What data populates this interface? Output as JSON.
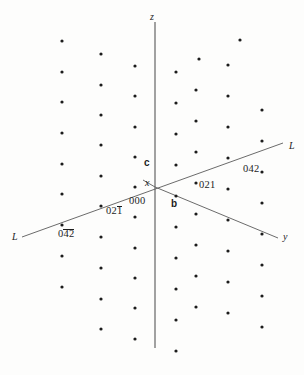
{
  "figure": {
    "type": "reciprocal-lattice-diagram",
    "background": "#fdfdfc",
    "ink": "#1c1c1c",
    "axis_color": "#8a8a8a",
    "line_color": "#5a5a5a",
    "dot_color": "#1c1c1c",
    "origin": {
      "x": 155,
      "y": 187
    }
  },
  "axes": [
    {
      "name": "z-axis",
      "label": "z",
      "label_x": 150,
      "label_y": 12,
      "x1": 155,
      "y1": 22,
      "x2": 155,
      "y2": 348
    },
    {
      "name": "y-axis",
      "label": "y",
      "label_x": 283,
      "label_y": 232,
      "x1": 155,
      "y1": 187,
      "x2": 278,
      "y2": 238
    },
    {
      "name": "x-axis",
      "label": "x",
      "label_x": 145,
      "label_y": 178,
      "x1": 155,
      "y1": 187,
      "x2": 143,
      "y2": 180
    }
  ],
  "reciprocal_rows": [
    {
      "name": "row-line-L",
      "label_left": "L",
      "label_right": "L",
      "label_left_x": 12,
      "label_left_y": 232,
      "label_right_x": 289,
      "label_right_y": 141,
      "x1": 22,
      "y1": 237,
      "x2": 283,
      "y2": 143
    }
  ],
  "vectors": [
    {
      "name": "c-vector",
      "label": "c",
      "x": 144,
      "y": 158
    },
    {
      "name": "b-vector",
      "label": "b",
      "x": 171,
      "y": 199
    }
  ],
  "indices": [
    {
      "name": "index-000",
      "text": "000",
      "x": 129,
      "y": 196,
      "bars": []
    },
    {
      "name": "index-021",
      "text": "021",
      "x": 199,
      "y": 180,
      "bars": []
    },
    {
      "name": "index-042",
      "text": "042",
      "x": 243,
      "y": 164,
      "bars": []
    },
    {
      "name": "index-021-bar",
      "text": "021",
      "x": 106,
      "y": 206,
      "bars": [
        2
      ]
    },
    {
      "name": "index-042-bar",
      "text": "042",
      "x": 58,
      "y": 229,
      "bars": [
        1,
        2
      ]
    }
  ],
  "lattice": {
    "description": "Sheared array of reciprocal lattice points, mirrored about the z axis",
    "dot_radius": 1.6,
    "points": [
      [
        62,
        41
      ],
      [
        101,
        54
      ],
      [
        135,
        66
      ],
      [
        62,
        72
      ],
      [
        101,
        85
      ],
      [
        135,
        96
      ],
      [
        62,
        102
      ],
      [
        101,
        115
      ],
      [
        135,
        127
      ],
      [
        62,
        133
      ],
      [
        101,
        145
      ],
      [
        135,
        157
      ],
      [
        62,
        164
      ],
      [
        101,
        176
      ],
      [
        62,
        194
      ],
      [
        101,
        206
      ],
      [
        135,
        187
      ],
      [
        62,
        225
      ],
      [
        101,
        237
      ],
      [
        135,
        217
      ],
      [
        62,
        256
      ],
      [
        101,
        268
      ],
      [
        135,
        248
      ],
      [
        62,
        287
      ],
      [
        101,
        299
      ],
      [
        135,
        278
      ],
      [
        135,
        308
      ],
      [
        101,
        329
      ],
      [
        135,
        339
      ],
      [
        176,
        72
      ],
      [
        176,
        103
      ],
      [
        176,
        134
      ],
      [
        176,
        165
      ],
      [
        176,
        196
      ],
      [
        176,
        227
      ],
      [
        176,
        258
      ],
      [
        176,
        289
      ],
      [
        176,
        320
      ],
      [
        176,
        351
      ],
      [
        196,
        90
      ],
      [
        196,
        121
      ],
      [
        196,
        152
      ],
      [
        196,
        183
      ],
      [
        196,
        214
      ],
      [
        196,
        245
      ],
      [
        196,
        276
      ],
      [
        196,
        307
      ],
      [
        228,
        65
      ],
      [
        228,
        96
      ],
      [
        228,
        127
      ],
      [
        228,
        158
      ],
      [
        228,
        189
      ],
      [
        228,
        220
      ],
      [
        228,
        251
      ],
      [
        228,
        282
      ],
      [
        228,
        313
      ],
      [
        262,
        110
      ],
      [
        262,
        141
      ],
      [
        262,
        172
      ],
      [
        262,
        203
      ],
      [
        262,
        234
      ],
      [
        262,
        265
      ],
      [
        262,
        296
      ],
      [
        262,
        327
      ],
      [
        240,
        40
      ],
      [
        199,
        59
      ]
    ]
  }
}
